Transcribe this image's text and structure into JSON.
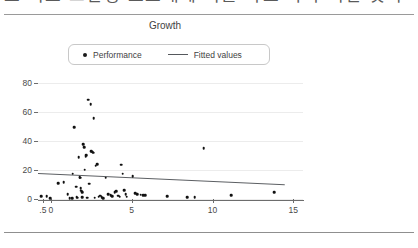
{
  "header": {
    "clipped_text": "도 의표 고인정 요소대에 의를 타보 따가 비빌 것이",
    "divider": "horizontal-rule"
  },
  "chart_data": {
    "type": "scatter",
    "title": "Growth",
    "xlabel": "",
    "ylabel": "",
    "grid": true,
    "legend_position": "top",
    "xlim": [
      -0.8,
      15.6
    ],
    "ylim": [
      0,
      84
    ],
    "yticks": [
      0,
      20,
      40,
      60,
      80
    ],
    "ytick_labels": [
      "0",
      "20",
      "40",
      "60",
      "80"
    ],
    "xticks": [
      -0.5,
      0,
      5,
      10,
      15
    ],
    "xtick_labels": [
      ".5",
      "0",
      "5",
      "10",
      "15"
    ],
    "series": [
      {
        "name": "Performance",
        "type": "scatter",
        "marker": "circle",
        "color": "#111111",
        "points": [
          [
            -0.6,
            2.0
          ],
          [
            -0.25,
            1.8
          ],
          [
            -0.05,
            0.7
          ],
          [
            0.45,
            11.0
          ],
          [
            0.8,
            11.6
          ],
          [
            1.05,
            3.3
          ],
          [
            1.15,
            0.6
          ],
          [
            1.3,
            0.5
          ],
          [
            1.35,
            17.5
          ],
          [
            1.45,
            49.5
          ],
          [
            1.55,
            8.4
          ],
          [
            1.6,
            1.4
          ],
          [
            1.65,
            1.0
          ],
          [
            1.72,
            28.8
          ],
          [
            1.78,
            15.2
          ],
          [
            1.8,
            14.6
          ],
          [
            1.85,
            7.5
          ],
          [
            1.88,
            5.6
          ],
          [
            1.92,
            4.6
          ],
          [
            1.95,
            1.2
          ],
          [
            2.0,
            37.6
          ],
          [
            2.05,
            35.8
          ],
          [
            2.1,
            20.3
          ],
          [
            2.15,
            29.0
          ],
          [
            2.2,
            30.2
          ],
          [
            2.25,
            0.8
          ],
          [
            2.32,
            68.5
          ],
          [
            2.38,
            10.6
          ],
          [
            2.45,
            65.3
          ],
          [
            2.5,
            33.0
          ],
          [
            2.55,
            32.6
          ],
          [
            2.6,
            31.8
          ],
          [
            2.65,
            55.5
          ],
          [
            2.7,
            0.9
          ],
          [
            2.78,
            23.0
          ],
          [
            2.85,
            24.0
          ],
          [
            2.95,
            1.6
          ],
          [
            3.05,
            2.2
          ],
          [
            3.15,
            1.1
          ],
          [
            3.25,
            0.6
          ],
          [
            3.4,
            14.6
          ],
          [
            3.55,
            3.5
          ],
          [
            3.7,
            2.6
          ],
          [
            3.8,
            1.9
          ],
          [
            3.95,
            4.8
          ],
          [
            4.05,
            5.2
          ],
          [
            4.15,
            2.4
          ],
          [
            4.25,
            1.7
          ],
          [
            4.35,
            23.5
          ],
          [
            4.45,
            17.3
          ],
          [
            4.55,
            6.0
          ],
          [
            4.62,
            3.4
          ],
          [
            4.7,
            1.5
          ],
          [
            5.05,
            15.8
          ],
          [
            5.2,
            4.1
          ],
          [
            5.35,
            3.2
          ],
          [
            5.55,
            2.9
          ],
          [
            5.7,
            2.8
          ],
          [
            5.85,
            2.7
          ],
          [
            7.2,
            2.1
          ],
          [
            8.45,
            1.2
          ],
          [
            8.9,
            1.1
          ],
          [
            9.45,
            34.8
          ],
          [
            11.15,
            2.5
          ],
          [
            13.8,
            4.5
          ]
        ]
      },
      {
        "name": "Fitted values",
        "type": "line",
        "color": "#5c5f63",
        "endpoints": [
          [
            -0.8,
            17.6
          ],
          [
            14.5,
            9.8
          ]
        ]
      }
    ]
  },
  "footer": {
    "divider": "horizontal-rule"
  }
}
